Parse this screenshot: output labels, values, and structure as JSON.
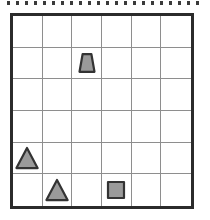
{
  "canvas": {
    "width": 210,
    "height": 220,
    "background": "#ffffff"
  },
  "tick_strip": {
    "name": "top-tick-strip",
    "count": 22,
    "first_x": 7,
    "spacing": 9,
    "top": 1,
    "tick_width": 3,
    "tick_height": 4,
    "color": "#3a3a3a"
  },
  "grid": {
    "name": "shape-grid",
    "rows": 6,
    "columns": 6,
    "left": 10,
    "top": 13,
    "width": 184,
    "height": 196,
    "border_color": "#2b2b2b",
    "border_width": 3,
    "line_color": "#8e8e8e",
    "line_width": 1,
    "cell_background": "#ffffff"
  },
  "style": {
    "shape_fill": "#9a9a9a",
    "shape_stroke": "#333333",
    "shape_stroke_width": 2.2
  },
  "shapes": [
    {
      "id": "shape-trapezoid-r2c3",
      "type": "trapezoid",
      "row": 2,
      "column": 3,
      "fill": "#9a9a9a",
      "stroke": "#333333",
      "size": 22
    },
    {
      "id": "shape-triangle-r5c1",
      "type": "triangle",
      "row": 5,
      "column": 1,
      "fill": "#9a9a9a",
      "stroke": "#333333",
      "size": 24
    },
    {
      "id": "shape-triangle-r6c2",
      "type": "triangle",
      "row": 6,
      "column": 2,
      "fill": "#9a9a9a",
      "stroke": "#333333",
      "size": 24
    },
    {
      "id": "shape-square-r6c4",
      "type": "square",
      "row": 6,
      "column": 4,
      "fill": "#9a9a9a",
      "stroke": "#333333",
      "size": 20
    }
  ],
  "cells": [
    {
      "row": 1,
      "column": 1,
      "shape": ""
    },
    {
      "row": 1,
      "column": 2,
      "shape": ""
    },
    {
      "row": 1,
      "column": 3,
      "shape": ""
    },
    {
      "row": 1,
      "column": 4,
      "shape": ""
    },
    {
      "row": 1,
      "column": 5,
      "shape": ""
    },
    {
      "row": 1,
      "column": 6,
      "shape": ""
    },
    {
      "row": 2,
      "column": 1,
      "shape": ""
    },
    {
      "row": 2,
      "column": 2,
      "shape": ""
    },
    {
      "row": 2,
      "column": 3,
      "shape": "trapezoid"
    },
    {
      "row": 2,
      "column": 4,
      "shape": ""
    },
    {
      "row": 2,
      "column": 5,
      "shape": ""
    },
    {
      "row": 2,
      "column": 6,
      "shape": ""
    },
    {
      "row": 3,
      "column": 1,
      "shape": ""
    },
    {
      "row": 3,
      "column": 2,
      "shape": ""
    },
    {
      "row": 3,
      "column": 3,
      "shape": ""
    },
    {
      "row": 3,
      "column": 4,
      "shape": ""
    },
    {
      "row": 3,
      "column": 5,
      "shape": ""
    },
    {
      "row": 3,
      "column": 6,
      "shape": ""
    },
    {
      "row": 4,
      "column": 1,
      "shape": ""
    },
    {
      "row": 4,
      "column": 2,
      "shape": ""
    },
    {
      "row": 4,
      "column": 3,
      "shape": ""
    },
    {
      "row": 4,
      "column": 4,
      "shape": ""
    },
    {
      "row": 4,
      "column": 5,
      "shape": ""
    },
    {
      "row": 4,
      "column": 6,
      "shape": ""
    },
    {
      "row": 5,
      "column": 1,
      "shape": "triangle"
    },
    {
      "row": 5,
      "column": 2,
      "shape": ""
    },
    {
      "row": 5,
      "column": 3,
      "shape": ""
    },
    {
      "row": 5,
      "column": 4,
      "shape": ""
    },
    {
      "row": 5,
      "column": 5,
      "shape": ""
    },
    {
      "row": 5,
      "column": 6,
      "shape": ""
    },
    {
      "row": 6,
      "column": 1,
      "shape": ""
    },
    {
      "row": 6,
      "column": 2,
      "shape": "triangle"
    },
    {
      "row": 6,
      "column": 3,
      "shape": ""
    },
    {
      "row": 6,
      "column": 4,
      "shape": "square"
    },
    {
      "row": 6,
      "column": 5,
      "shape": ""
    },
    {
      "row": 6,
      "column": 6,
      "shape": ""
    }
  ]
}
